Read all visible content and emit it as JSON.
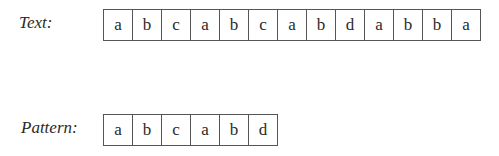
{
  "text": {
    "label": "Text:",
    "chars": [
      "a",
      "b",
      "c",
      "a",
      "b",
      "c",
      "a",
      "b",
      "d",
      "a",
      "b",
      "b",
      "a"
    ]
  },
  "pattern": {
    "label": "Pattern:",
    "chars": [
      "a",
      "b",
      "c",
      "a",
      "b",
      "d"
    ]
  }
}
